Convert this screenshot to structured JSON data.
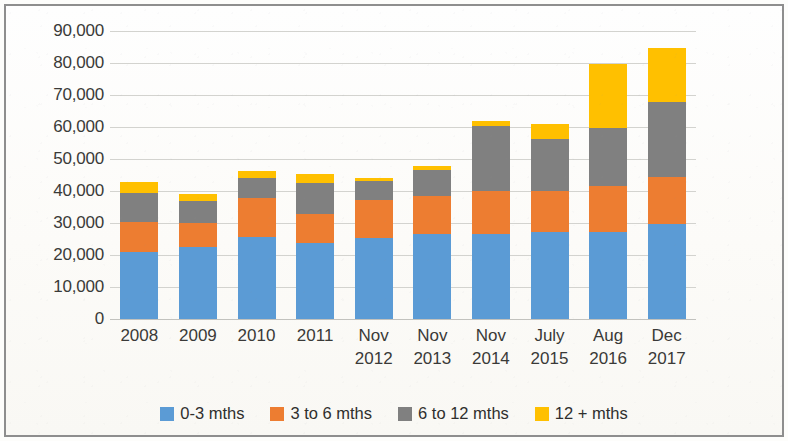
{
  "chart_data": {
    "type": "bar",
    "subtype": "stacked-column",
    "title": "",
    "xlabel": "",
    "ylabel": "",
    "ylim": [
      0,
      90000
    ],
    "ytick_step": 10000,
    "ytick_labels": [
      "90,000",
      "80,000",
      "70,000",
      "60,000",
      "50,000",
      "40,000",
      "30,000",
      "20,000",
      "10,000",
      "0"
    ],
    "ytick_values": [
      90000,
      80000,
      70000,
      60000,
      50000,
      40000,
      30000,
      20000,
      10000,
      0
    ],
    "grid": true,
    "grid_axis": "y",
    "legend_position": "bottom",
    "categories": [
      "2008",
      "2009",
      "2010",
      "2011",
      "Nov\n2012",
      "Nov\n2013",
      "Nov\n2014",
      "July\n2015",
      "Aug\n2016",
      "Dec\n2017"
    ],
    "series": [
      {
        "name": "0-3 mths",
        "color": "#5b9bd5",
        "values": [
          21000,
          22500,
          25700,
          23800,
          25400,
          26600,
          26600,
          27200,
          27200,
          29700
        ]
      },
      {
        "name": "3 to 6 mths",
        "color": "#ed7d31",
        "values": [
          9400,
          7500,
          12200,
          9100,
          11900,
          11900,
          13400,
          12800,
          14400,
          14700
        ]
      },
      {
        "name": "6 to 12 mths",
        "color": "#808080",
        "values": [
          9100,
          6900,
          6300,
          9700,
          5900,
          8100,
          20300,
          16200,
          18100,
          23400
        ]
      },
      {
        "name": "12 + mths",
        "color": "#ffc000",
        "values": [
          3400,
          2200,
          1900,
          2800,
          900,
          1300,
          1600,
          4700,
          20000,
          16900
        ]
      }
    ],
    "totals": [
      42900,
      39100,
      46100,
      45400,
      44100,
      47900,
      61900,
      60900,
      79700,
      84700
    ]
  }
}
